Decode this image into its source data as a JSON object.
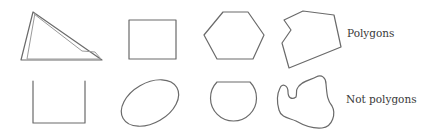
{
  "figure": {
    "rows": [
      {
        "label": "Polygons",
        "shapes": [
          {
            "name": "sketchy-triangle",
            "kind": "polygon"
          },
          {
            "name": "rectangle",
            "kind": "polygon"
          },
          {
            "name": "hexagon",
            "kind": "polygon"
          },
          {
            "name": "irregular-concave-polygon",
            "kind": "polygon"
          }
        ]
      },
      {
        "label": "Not polygons",
        "shapes": [
          {
            "name": "open-u-shape",
            "kind": "not-polygon"
          },
          {
            "name": "ellipse",
            "kind": "not-polygon"
          },
          {
            "name": "circle-segment",
            "kind": "not-polygon"
          },
          {
            "name": "closed-curve-blob",
            "kind": "not-polygon"
          }
        ]
      }
    ],
    "colors": {
      "stroke": "#6a6a6a",
      "text": "#3a3a3a",
      "background": "#ffffff"
    }
  }
}
